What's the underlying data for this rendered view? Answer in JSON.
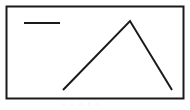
{
  "figure": {
    "background_color": "#ffffff",
    "width": 190,
    "height": 110,
    "frame": {
      "name": "plot-border",
      "x": 6.5,
      "y": 6.5,
      "width": 177,
      "height": 92,
      "stroke_color": "#1a1a1a",
      "stroke_width": 2,
      "fill_color": "#ffffff"
    },
    "legend": {
      "position": "top-left",
      "entries": [
        {
          "name": "series-1",
          "label": "",
          "swatch_type": "line",
          "color": "#1a1a1a",
          "line_width": 2,
          "x1": 24,
          "x2": 60,
          "y": 23
        }
      ]
    }
  },
  "chart_data": {
    "type": "line",
    "title": "",
    "subtitle": "",
    "xlabel": "",
    "ylabel": "",
    "grid": false,
    "legend_position": "top-left",
    "axis_visible": false,
    "tick_labels_visible": false,
    "xlim": [
      0,
      100
    ],
    "ylim": [
      0,
      100
    ],
    "annotations": [],
    "series": [
      {
        "name": "series-1",
        "color": "#1a1a1a",
        "line_width": 2,
        "marker": "none",
        "x": [
          0,
          50,
          100
        ],
        "y": [
          0,
          100,
          0
        ],
        "points_px": [
          {
            "x": 63,
            "y": 90
          },
          {
            "x": 130,
            "y": 21
          },
          {
            "x": 172,
            "y": 90
          }
        ],
        "description": "Rises linearly from lower-left to a single peak, then falls to lower-right"
      }
    ],
    "shape_summary": "inverted-V / triangular peak polyline"
  },
  "caption": {
    "visible": false,
    "text": ""
  }
}
